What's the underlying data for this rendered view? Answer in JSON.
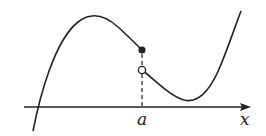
{
  "diagram": {
    "type": "function-graph-jump-discontinuity",
    "axis": {
      "label": "x",
      "color": "#222222"
    },
    "point_label": "a",
    "colors": {
      "curve": "#222222",
      "background": "#ffffff"
    },
    "elements": {
      "left_branch": "curve rising from below x-axis, local maximum, decreasing to a filled (closed) point at x=a",
      "closed_point": "filled dot at x=a (function value)",
      "open_point": "open circle at x=a (limit from the right)",
      "right_branch": "curve from open point decreasing to a local minimum above axis, then rising steeply",
      "guide_line": "dashed vertical line from x=a on axis up to the points"
    }
  }
}
